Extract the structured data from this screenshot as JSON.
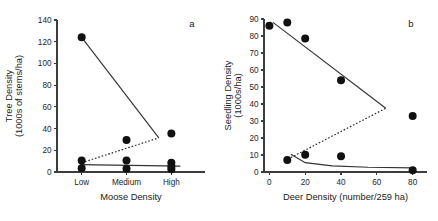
{
  "figure": {
    "background": "#ffffff",
    "point_color": "#111111",
    "axis_color": "#3d3d3d"
  },
  "chart_data": [
    {
      "type": "scatter",
      "panel_label": "a",
      "title": "",
      "xlabel": "Moose Density",
      "ylabel": "Tree Density\n(1000s of stems/ha)",
      "ylabel_line1": "Tree Density",
      "ylabel_line2": "(1000s of stems/ha)",
      "categories": [
        "Low",
        "Medium",
        "High"
      ],
      "category_positions": [
        1,
        2,
        3
      ],
      "xlim": [
        0.45,
        3.75
      ],
      "ylim": [
        0,
        140
      ],
      "yticks": [
        0,
        20,
        40,
        60,
        80,
        100,
        120,
        140
      ],
      "ytick_labels": [
        "0",
        "20",
        "40",
        "60",
        "80",
        "100",
        "120",
        "140"
      ],
      "grid": false,
      "legend": "none",
      "series": [
        {
          "name": "tree density observations",
          "marker": "filled-circle",
          "points": [
            {
              "x": 1,
              "y": 124
            },
            {
              "x": 1,
              "y": 10.5
            },
            {
              "x": 1,
              "y": 3.5
            },
            {
              "x": 2,
              "y": 29.5
            },
            {
              "x": 2,
              "y": 10.5
            },
            {
              "x": 2,
              "y": 3.0
            },
            {
              "x": 3,
              "y": 35.5
            },
            {
              "x": 3,
              "y": 8.5
            },
            {
              "x": 3,
              "y": 5.0
            },
            {
              "x": 3,
              "y": 2.5
            }
          ]
        }
      ],
      "fit_lines": [
        {
          "name": "upper-solid-trend",
          "style": "solid",
          "points": [
            {
              "x": 1,
              "y": 124
            },
            {
              "x": 2.72,
              "y": 31.5
            }
          ]
        },
        {
          "name": "lower-solid-trend",
          "style": "solid",
          "points": [
            {
              "x": 0.97,
              "y": 6.8
            },
            {
              "x": 3.2,
              "y": 5.4
            }
          ]
        },
        {
          "name": "dotted-trend",
          "style": "dotted",
          "points": [
            {
              "x": 1.0,
              "y": 8.5
            },
            {
              "x": 2.72,
              "y": 31.5
            }
          ]
        }
      ]
    },
    {
      "type": "scatter",
      "panel_label": "b",
      "title": "",
      "xlabel": "Deer Density (number/259 ha)",
      "ylabel": "Seedling Density\n(1000s/ha)",
      "ylabel_line1": "Seedling Density",
      "ylabel_line2": "(1000s/ha)",
      "xlim": [
        -3,
        88
      ],
      "ylim": [
        0,
        90
      ],
      "xticks": [
        0,
        20,
        40,
        60,
        80
      ],
      "xtick_labels": [
        "0",
        "20",
        "40",
        "60",
        "80"
      ],
      "yticks": [
        0,
        10,
        20,
        30,
        40,
        50,
        60,
        70,
        80,
        90
      ],
      "ytick_labels": [
        "0",
        "10",
        "20",
        "30",
        "40",
        "50",
        "60",
        "70",
        "80",
        "90"
      ],
      "grid": false,
      "legend": "none",
      "series": [
        {
          "name": "seedling density observations",
          "marker": "filled-circle",
          "points": [
            {
              "x": 0,
              "y": 86
            },
            {
              "x": 10,
              "y": 88
            },
            {
              "x": 20,
              "y": 78.5
            },
            {
              "x": 40,
              "y": 54
            },
            {
              "x": 80,
              "y": 33
            },
            {
              "x": 10,
              "y": 7
            },
            {
              "x": 20,
              "y": 10.2
            },
            {
              "x": 40,
              "y": 9.3
            },
            {
              "x": 80,
              "y": 1
            }
          ]
        }
      ],
      "fit_lines": [
        {
          "name": "upper-solid-trend",
          "style": "solid",
          "points": [
            {
              "x": 2,
              "y": 88
            },
            {
              "x": 65,
              "y": 37.5
            }
          ]
        },
        {
          "name": "lower-solid-curve",
          "style": "solid",
          "points": [
            {
              "x": 12,
              "y": 10.5
            },
            {
              "x": 20,
              "y": 5.5
            },
            {
              "x": 35,
              "y": 3.6
            },
            {
              "x": 55,
              "y": 2.8
            },
            {
              "x": 80,
              "y": 2.4
            }
          ]
        },
        {
          "name": "dotted-trend",
          "style": "dotted",
          "points": [
            {
              "x": 12,
              "y": 8.5
            },
            {
              "x": 65,
              "y": 37.5
            }
          ]
        }
      ]
    }
  ]
}
